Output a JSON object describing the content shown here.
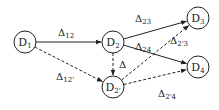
{
  "diagram": {
    "title": "",
    "nodes": [
      {
        "id": "D1",
        "label": "D",
        "sub": "1",
        "x": 25,
        "y": 42
      },
      {
        "id": "D2",
        "label": "D",
        "sub": "2",
        "x": 113,
        "y": 42
      },
      {
        "id": "D2p",
        "label": "D",
        "sub": "2'",
        "x": 113,
        "y": 87
      },
      {
        "id": "D3",
        "label": "D",
        "sub": "3",
        "x": 198,
        "y": 18
      },
      {
        "id": "D4",
        "label": "D",
        "sub": "4",
        "x": 198,
        "y": 67
      }
    ],
    "edges": [
      {
        "from": "D1",
        "to": "D2",
        "style": "solid",
        "label": "Δ",
        "sub": "12",
        "lx": 58,
        "ly": 36
      },
      {
        "from": "D1",
        "to": "D2p",
        "style": "dashed",
        "label": "Δ",
        "sub": "12'",
        "lx": 56,
        "ly": 80
      },
      {
        "from": "D2",
        "to": "D2p",
        "style": "dashed",
        "label": "Δ",
        "sub": "",
        "lx": 119,
        "ly": 68
      },
      {
        "from": "D2",
        "to": "D3",
        "style": "solid",
        "label": "Δ",
        "sub": "23",
        "lx": 135,
        "ly": 22
      },
      {
        "from": "D2",
        "to": "D4",
        "style": "solid",
        "label": "Δ",
        "sub": "24",
        "lx": 135,
        "ly": 50
      },
      {
        "from": "D2p",
        "to": "D3",
        "style": "dashed",
        "label": "Δ",
        "sub": "2'3",
        "lx": 170,
        "ly": 44
      },
      {
        "from": "D2p",
        "to": "D4",
        "style": "dashed",
        "label": "Δ",
        "sub": "2'4",
        "lx": 158,
        "ly": 97
      }
    ],
    "colors": {
      "stroke": "#222222",
      "background": "#ffffff"
    }
  }
}
